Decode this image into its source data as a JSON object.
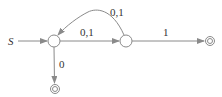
{
  "diagram": {
    "type": "finite-automaton",
    "start_label": "S",
    "colors": {
      "stroke": "#8a8a8a",
      "text": "#333333",
      "background": "#ffffff"
    },
    "states": [
      {
        "id": "q0",
        "x": 54,
        "y": 41,
        "accepting": false,
        "initial": true
      },
      {
        "id": "q1",
        "x": 126,
        "y": 41,
        "accepting": false,
        "initial": false
      },
      {
        "id": "q2",
        "x": 210,
        "y": 41,
        "accepting": true,
        "initial": false
      },
      {
        "id": "q3",
        "x": 55,
        "y": 89,
        "accepting": true,
        "initial": false
      }
    ],
    "transitions": [
      {
        "from": "q0",
        "to": "q1",
        "label": "0,1"
      },
      {
        "from": "q1",
        "to": "q0",
        "label": "0,1",
        "curved": true
      },
      {
        "from": "q1",
        "to": "q2",
        "label": "1"
      },
      {
        "from": "q0",
        "to": "q3",
        "label": "0"
      }
    ]
  }
}
